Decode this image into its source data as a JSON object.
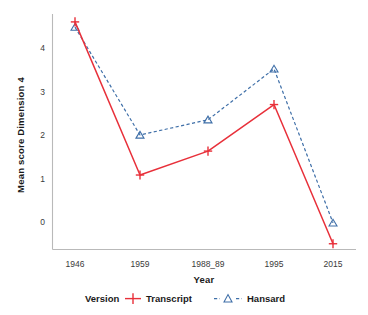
{
  "chart_data": {
    "type": "line",
    "title": "",
    "xlabel": "Year",
    "ylabel": "Mean score Dimension 4",
    "categories": [
      "1946",
      "1959",
      "1988_89",
      "1995",
      "2015"
    ],
    "series": [
      {
        "name": "Transcript",
        "values": [
          4.6,
          1.08,
          1.63,
          2.7,
          -0.5
        ],
        "color": "#e8303a",
        "marker": "plus",
        "linestyle": "solid"
      },
      {
        "name": "Hansard",
        "values": [
          4.48,
          2.0,
          2.35,
          3.52,
          -0.02
        ],
        "color": "#3f6fa8",
        "marker": "triangle",
        "linestyle": "dashed"
      }
    ],
    "yticks": [
      0,
      1,
      2,
      3,
      4
    ],
    "ytick_labels": [
      "0",
      "1",
      "2",
      "3",
      "4"
    ],
    "ylim": [
      -0.62,
      4.9
    ],
    "grid": false,
    "legend_position": "bottom",
    "legend_title": "Version"
  },
  "axes": {
    "y_title": "Mean score Dimension 4",
    "x_title": "Year",
    "y_tick_0": "0",
    "y_tick_1": "1",
    "y_tick_2": "2",
    "y_tick_3": "3",
    "y_tick_4": "4",
    "x_tick_0": "1946",
    "x_tick_1": "1959",
    "x_tick_2": "1988_89",
    "x_tick_3": "1995",
    "x_tick_4": "2015"
  },
  "legend": {
    "title": "Version",
    "item_transcript": "Transcript",
    "item_hansard": "Hansard"
  },
  "colors": {
    "transcript": "#e8303a",
    "hansard": "#3f6fa8",
    "axis": "#b9b9b9",
    "text": "#1a1a1a"
  }
}
